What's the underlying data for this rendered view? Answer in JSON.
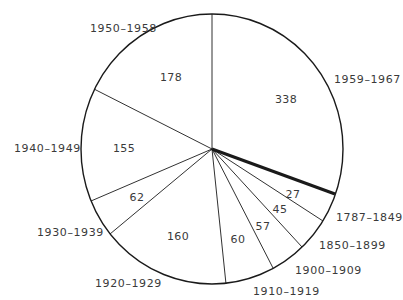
{
  "chart_data": {
    "type": "pie",
    "title": "",
    "categories": [
      "1959–1967",
      "1787–1849",
      "1850–1899",
      "1900–1909",
      "1910–1919",
      "1920–1929",
      "1930–1939",
      "1940–1949",
      "1950–1958"
    ],
    "values": [
      338,
      27,
      45,
      57,
      60,
      160,
      62,
      155,
      178
    ],
    "highlighted_boundary": "thick line between 1959–1967 and 1787–1849",
    "legend": "none (labels placed outside slices)",
    "data_labels": "values inside slices"
  },
  "geometry": {
    "cx": 212,
    "cy": 149,
    "rx": 131,
    "ry": 135,
    "spoke_ends": [
      {
        "x": 212,
        "y": 14
      },
      {
        "x": 335,
        "y": 194,
        "thick": true
      },
      {
        "x": 323,
        "y": 221
      },
      {
        "x": 302,
        "y": 247
      },
      {
        "x": 273,
        "y": 268
      },
      {
        "x": 226,
        "y": 284
      },
      {
        "x": 110,
        "y": 234
      },
      {
        "x": 91,
        "y": 201
      },
      {
        "x": 94,
        "y": 89
      }
    ]
  },
  "slices": [
    {
      "label": "1959–1967",
      "value": "338",
      "lx": 334,
      "ly": 80,
      "vx": 286,
      "vy": 100
    },
    {
      "label": "1787–1849",
      "value": "27",
      "lx": 336,
      "ly": 218,
      "vx": 293,
      "vy": 195
    },
    {
      "label": "1850–1899",
      "value": "45",
      "lx": 319,
      "ly": 246,
      "vx": 280,
      "vy": 210
    },
    {
      "label": "1900–1909",
      "value": "57",
      "lx": 295,
      "ly": 271,
      "vx": 263,
      "vy": 227
    },
    {
      "label": "1910–1919",
      "value": "60",
      "lx": 253,
      "ly": 292,
      "vx": 238,
      "vy": 240
    },
    {
      "label": "1920–1929",
      "value": "160",
      "lx": 95,
      "ly": 284,
      "vx": 178,
      "vy": 237
    },
    {
      "label": "1930–1939",
      "value": "62",
      "lx": 37,
      "ly": 233,
      "vx": 137,
      "vy": 198
    },
    {
      "label": "1940–1949",
      "value": "155",
      "lx": 14,
      "ly": 149,
      "vx": 124,
      "vy": 149
    },
    {
      "label": "1950–1958",
      "value": "178",
      "lx": 90,
      "ly": 29,
      "vx": 171,
      "vy": 78
    }
  ]
}
